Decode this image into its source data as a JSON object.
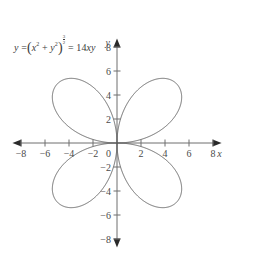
{
  "figure": {
    "title": "",
    "equation": {
      "lhs": "y",
      "base_open": "(",
      "base_x": "x",
      "base_x_exp": "2",
      "plus": "+",
      "base_y": "y",
      "base_y_exp": "2",
      "base_close": ")",
      "power_num": "3",
      "power_den": "2",
      "eq": "=",
      "rhs_coef": "14",
      "rhs_vars": "xy",
      "text": "y = (x^2 + y^2)^(3/2) = 14xy"
    },
    "axis_labels": {
      "x": "x",
      "y": "y"
    },
    "colors": {
      "curve": "#5a5a5a",
      "axis": "#6e6e6e",
      "text": "#4a4a4a",
      "background": "#ffffff"
    }
  },
  "chart_data": {
    "type": "line",
    "title": "",
    "subtitle": "",
    "xlabel": "x",
    "ylabel": "y",
    "xlim": [
      -8.8,
      8.8
    ],
    "ylim": [
      -8.8,
      8.8
    ],
    "grid": false,
    "legend": null,
    "equation": "(x^2 + y^2)^(3/2) = 14xy",
    "curve_name": "four-petal rose",
    "polar_form": "r = 14 sin(theta) cos(theta) = 7 sin(2 theta)",
    "petal_max_radius": 7,
    "petal_tip_points": [
      [
        4.95,
        4.95
      ],
      [
        -4.95,
        4.95
      ],
      [
        -4.95,
        -4.95
      ],
      [
        4.95,
        -4.95
      ]
    ],
    "xticks": [
      -8,
      -6,
      -4,
      -2,
      0,
      2,
      4,
      6,
      8
    ],
    "xticklabels": [
      "−8",
      "−6",
      "−4",
      "−2",
      "0",
      "2",
      "4",
      "6",
      "8"
    ],
    "yticks": [
      -8,
      -6,
      -4,
      -2,
      2,
      4,
      6,
      8
    ],
    "yticklabels": [
      "−8",
      "−6",
      "−4",
      "−2",
      "2",
      "4",
      "6",
      "8"
    ],
    "series": [
      {
        "name": "(x^2+y^2)^(3/2) = 14xy",
        "color": "#5a5a5a",
        "closed": true,
        "description": "Rose with four petals along the diagonals y=x and y=-x"
      }
    ]
  }
}
